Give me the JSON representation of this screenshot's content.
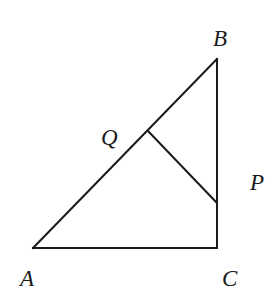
{
  "diagram": {
    "type": "right-triangle",
    "points": {
      "A": {
        "label": "A",
        "x": 33,
        "y": 248
      },
      "B": {
        "label": "B",
        "x": 217,
        "y": 59
      },
      "C": {
        "label": "C",
        "x": 217,
        "y": 248
      },
      "Q": {
        "label": "Q",
        "x": 148,
        "y": 131
      },
      "P": {
        "label": "P",
        "x": 217,
        "y": 203
      }
    },
    "segments": [
      "AB",
      "BC",
      "CA",
      "QP"
    ],
    "labels": {
      "A": "A",
      "B": "B",
      "C": "C",
      "Q": "Q",
      "P": "P"
    },
    "stroke_color": "#1a1a1a"
  }
}
